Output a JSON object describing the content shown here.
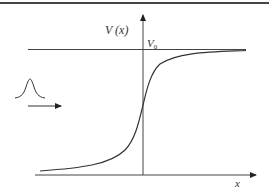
{
  "diagram": {
    "title": "",
    "labels": {
      "potential": "V (x)",
      "v0_main": "V",
      "v0_sub": "0",
      "x_axis": "x"
    },
    "colors": {
      "stroke": "#333333",
      "axis": "#3a3a3a",
      "background": "#ffffff"
    },
    "elements": [
      "top-border-line",
      "vertical-axis-with-arrow",
      "horizontal-x-axis-with-arrow",
      "asymptote-line-V0",
      "step-potential-curve",
      "wave-packet",
      "propagation-arrow"
    ]
  }
}
